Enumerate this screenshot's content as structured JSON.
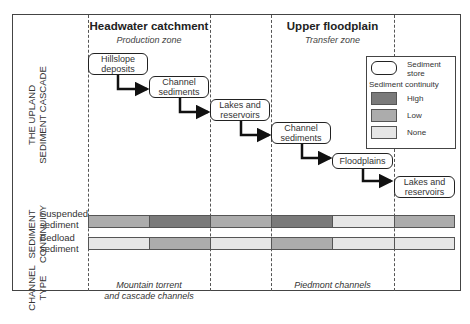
{
  "zones": [
    {
      "title": "Headwater catchment",
      "subtitle": "Production zone"
    },
    {
      "title": "Upper floodplain",
      "subtitle": "Transfer zone"
    }
  ],
  "row_labels": {
    "cascade": [
      "THE UPLAND",
      "SEDIMENT CASCADE"
    ],
    "continuity": [
      "SEDIMENT",
      "CONTINUITY"
    ],
    "channel_type": [
      "CHANNEL",
      "TYPE"
    ]
  },
  "cascade_boxes": [
    {
      "label1": "Hillslope",
      "label2": "deposits"
    },
    {
      "label1": "Channel",
      "label2": "sediments"
    },
    {
      "label1": "Lakes and",
      "label2": "reservoirs"
    },
    {
      "label1": "Channel",
      "label2": "sediments"
    },
    {
      "label1": "Floodplains",
      "label2": ""
    },
    {
      "label1": "Lakes and",
      "label2": "reservoirs"
    }
  ],
  "legend": {
    "store_label1": "Sediment",
    "store_label2": "store",
    "continuity_title": "Sediment continuity",
    "items": [
      {
        "label": "High",
        "color": "#7a7a7a"
      },
      {
        "label": "Low",
        "color": "#acacac"
      },
      {
        "label": "None",
        "color": "#e6e6e6"
      }
    ]
  },
  "continuity_rows": [
    {
      "label1": "Suspended",
      "label2": "sediment",
      "levels": [
        "Low",
        "High",
        "Low",
        "High",
        "None",
        "Low"
      ]
    },
    {
      "label1": "Bedload",
      "label2": "sediment",
      "levels": [
        "None",
        "Low",
        "None",
        "Low",
        "None",
        "None"
      ]
    }
  ],
  "channel_types": [
    {
      "label1": "Mountain torrent",
      "label2": "and cascade channels"
    },
    {
      "label1": "Piedmont channels",
      "label2": ""
    }
  ],
  "colors": {
    "High": "#7a7a7a",
    "Low": "#acacac",
    "None": "#e6e6e6"
  }
}
